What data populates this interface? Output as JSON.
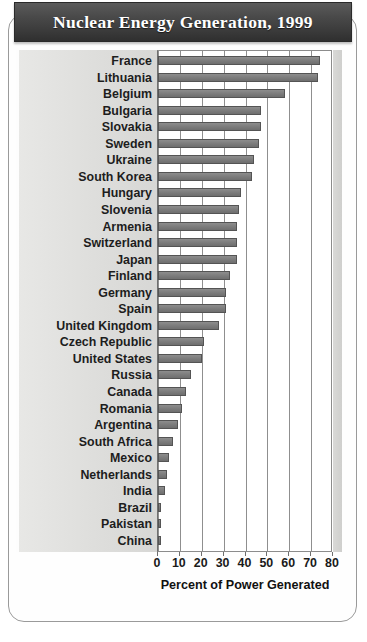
{
  "title": "Nuclear Energy Generation, 1999",
  "colors": {
    "banner_dark": "#3c3c3c",
    "banner_text": "#ffffff",
    "bar_fill": "#7e7e7e",
    "bar_stroke": "#545454",
    "label_band": "#e0e0de",
    "grid": "#8f8f8f",
    "card_border": "#9a9a9a"
  },
  "axis": {
    "title": "Percent of Power Generated",
    "ticks": [
      0,
      10,
      20,
      30,
      40,
      50,
      60,
      70,
      80
    ]
  },
  "chart_data": {
    "type": "bar",
    "orientation": "horizontal",
    "title": "Nuclear Energy Generation, 1999",
    "xlabel": "Percent of Power Generated",
    "ylabel": "",
    "xlim": [
      0,
      80
    ],
    "grid": true,
    "legend": null,
    "categories": [
      "France",
      "Lithuania",
      "Belgium",
      "Bulgaria",
      "Slovakia",
      "Sweden",
      "Ukraine",
      "South Korea",
      "Hungary",
      "Slovenia",
      "Armenia",
      "Switzerland",
      "Japan",
      "Finland",
      "Germany",
      "Spain",
      "United Kingdom",
      "Czech Republic",
      "United States",
      "Russia",
      "Canada",
      "Romania",
      "Argentina",
      "South Africa",
      "Mexico",
      "Netherlands",
      "India",
      "Brazil",
      "Pakistan",
      "China"
    ],
    "values": [
      74,
      73,
      58,
      47,
      47,
      46,
      44,
      43,
      38,
      37,
      36,
      36,
      36,
      33,
      31,
      31,
      28,
      21,
      20,
      15,
      13,
      11,
      9,
      7,
      5,
      4,
      3,
      1,
      1,
      1
    ]
  }
}
